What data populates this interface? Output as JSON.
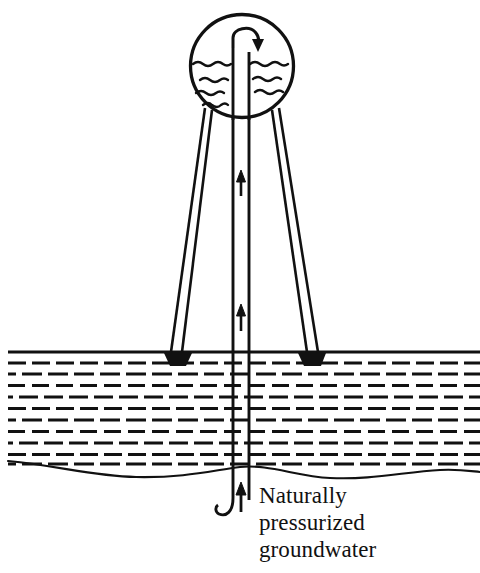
{
  "figure": {
    "type": "technical-line-diagram",
    "background_color": "#ffffff",
    "ink_color": "#111111"
  },
  "caption": {
    "lines": [
      "Naturally",
      "pressurized",
      "groundwater"
    ],
    "line1": "Naturally",
    "line2": "pressurized",
    "line3": "groundwater",
    "font_size_px": 23,
    "x_px": 259,
    "baselines_px": [
      503,
      530,
      557
    ],
    "color": "#111111"
  },
  "tank": {
    "label": "spherical-storage-tank",
    "center_x_px": 242,
    "center_y_px": 66,
    "radius_px": 52,
    "stroke_width_px": 3.2,
    "fill": "#ffffff",
    "water": {
      "label": "water-surface-and-ripples",
      "surface_level_y_px": 64,
      "surface_left_x_px": 192,
      "surface_right_x_px": 294,
      "ripple_rows_left_y_px": [
        78,
        92,
        104
      ],
      "ripple_rows_right_y_px": [
        78,
        92
      ],
      "stroke_width_px": 2.4
    }
  },
  "riser": {
    "label": "central-vertical-riser-pipe",
    "left_wall_x_px": 233,
    "right_wall_x_px": 249,
    "top_y_px": 44,
    "bottom_y_px": 500,
    "stroke_width_px": 2.8,
    "outlet": {
      "label": "curved-discharge-outlet",
      "description": "pipe curves up and over to the right, arrow points down into tank",
      "arc_top_y_px": 30,
      "arrow_tip_x_px": 258,
      "arrow_tip_y_px": 48
    },
    "intake": {
      "label": "hooked-intake-at-aquifer",
      "description": "left wall curves into a J hook below the water table",
      "hook_bottom_y_px": 516,
      "hook_left_x_px": 218
    },
    "flow_arrows": [
      {
        "name": "flow-arrow-upper",
        "x_px": 241,
        "tail_y_px": 195,
        "tip_y_px": 172,
        "direction": "up"
      },
      {
        "name": "flow-arrow-lower",
        "x_px": 241,
        "tail_y_px": 330,
        "tip_y_px": 305,
        "direction": "up"
      },
      {
        "name": "flow-arrow-intake",
        "x_px": 241,
        "tail_y_px": 510,
        "tip_y_px": 484,
        "direction": "up"
      }
    ]
  },
  "legs": [
    {
      "name": "support-leg-left",
      "top_x_px": 207,
      "top_y_px": 112,
      "base_x_px": 178,
      "base_y_px": 352,
      "width_px": 7,
      "stroke_width_px": 2.6
    },
    {
      "name": "support-leg-right",
      "top_x_px": 278,
      "top_y_px": 112,
      "base_x_px": 312,
      "base_y_px": 352,
      "width_px": 7,
      "stroke_width_px": 2.6
    }
  ],
  "footings": [
    {
      "name": "footing-left",
      "center_x_px": 178,
      "y_px": 353,
      "half_width_px": 13,
      "height_px": 11
    },
    {
      "name": "footing-right",
      "center_x_px": 312,
      "y_px": 353,
      "half_width_px": 13,
      "height_px": 11
    }
  ],
  "ground": {
    "label": "ground-aquifer-cross-section",
    "surface_line": {
      "name": "ground-surface-line",
      "y_px": 352,
      "x_start_px": 8,
      "x_end_px": 480,
      "stroke_width_px": 3
    },
    "hatching": {
      "name": "aquifer-dash-hatching",
      "description": "horizontal dashed rows denoting saturated soil",
      "x_start_px": 8,
      "x_end_px": 480,
      "y_start_px": 362,
      "y_end_px": 466,
      "row_spacing_px": 11.5,
      "dash_length_px": 18,
      "dash_gap_px": 6,
      "stroke_width_px": 3,
      "row_offset_px": 12
    },
    "water_table": {
      "name": "water-table-wavy-line",
      "description": "thin undulating line marking base of the saturated zone",
      "y_mean_px": 468,
      "amplitude_px": 9,
      "x_start_px": 8,
      "x_end_px": 480,
      "stroke_width_px": 2
    }
  }
}
